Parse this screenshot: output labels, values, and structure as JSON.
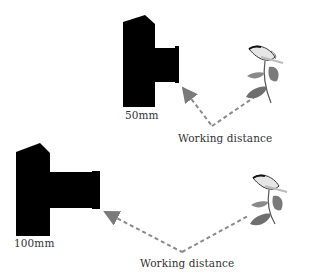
{
  "diagram": {
    "panels": [
      {
        "lens_label": "50mm",
        "distance_label": "Working distance"
      },
      {
        "lens_label": "100mm",
        "distance_label": "Working distance"
      }
    ],
    "icons": [
      "camera-icon",
      "butterfly-on-plant-icon",
      "dashed-arrow-icon"
    ],
    "colors": {
      "camera": "#000000",
      "arrow": "#8a8a8a",
      "leaf": "#6e6e6e",
      "text": "#333333"
    }
  }
}
